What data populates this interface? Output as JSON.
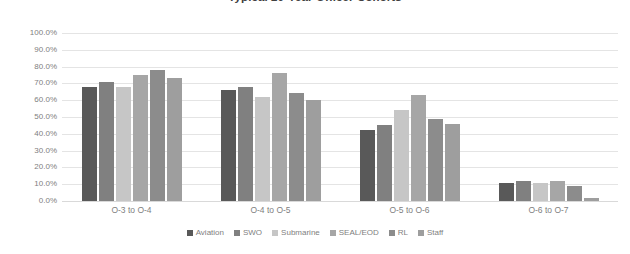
{
  "chart_data": {
    "type": "bar",
    "title": "Typical 20-Year Officer Cohorts",
    "xlabel": "",
    "ylabel": "",
    "ylim": [
      0,
      100
    ],
    "yticks": [
      "0.0%",
      "10.0%",
      "20.0%",
      "30.0%",
      "40.0%",
      "50.0%",
      "60.0%",
      "70.0%",
      "80.0%",
      "90.0%",
      "100.0%"
    ],
    "grid": true,
    "legend_position": "bottom",
    "categories": [
      "O-3 to O-4",
      "O-4 to O-5",
      "O-5 to O-6",
      "O-6 to O-7"
    ],
    "series": [
      {
        "name": "Aviation",
        "color": "#595959",
        "values": [
          68,
          66,
          42,
          11
        ]
      },
      {
        "name": "SWO",
        "color": "#808080",
        "values": [
          71,
          68,
          45,
          12
        ]
      },
      {
        "name": "Submarine",
        "color": "#c6c6c6",
        "values": [
          68,
          62,
          54,
          11
        ]
      },
      {
        "name": "SEAL/EOD",
        "color": "#a6a6a6",
        "values": [
          75,
          76,
          63,
          12
        ]
      },
      {
        "name": "RL",
        "color": "#8c8c8c",
        "values": [
          78,
          64,
          49,
          9
        ]
      },
      {
        "name": "Staff",
        "color": "#9e9e9e",
        "values": [
          73,
          60,
          46,
          2
        ]
      }
    ]
  }
}
